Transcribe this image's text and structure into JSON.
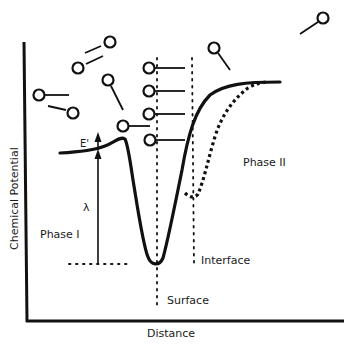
{
  "diagram": {
    "axes": {
      "y_label": "Chemical Potential",
      "x_label": "Distance"
    },
    "regions": {
      "phase1_label": "Phase I",
      "phase2_label": "Phase II"
    },
    "markers": {
      "surface_label": "Surface",
      "interface_label": "Interface"
    },
    "annotations": {
      "energy_barrier": "E'",
      "well_depth": "λ"
    },
    "curves": {
      "solid_label": "potential curve (adsorption at surface)",
      "dotted_label": "potential curve (interface)"
    },
    "colors": {
      "ink": "#111111",
      "background": "#ffffff"
    }
  }
}
